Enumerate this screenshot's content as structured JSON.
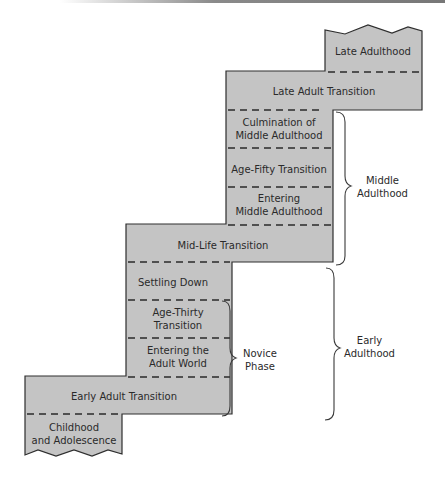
{
  "diagram": {
    "type": "staircase developmental periods",
    "fill_color": "#c4c4c4",
    "outline_color": "#2e2e2e",
    "stages": [
      {
        "id": "childhood",
        "label_line1": "Childhood",
        "label_line2": "and Adolescence"
      },
      {
        "id": "early-adult-transition",
        "label": "Early Adult Transition"
      },
      {
        "id": "entering-adult-world",
        "label_line1": "Entering the",
        "label_line2": "Adult World"
      },
      {
        "id": "age-thirty-transition",
        "label_line1": "Age-Thirty",
        "label_line2": "Transition"
      },
      {
        "id": "settling-down",
        "label": "Settling Down"
      },
      {
        "id": "mid-life-transition",
        "label": "Mid-Life Transition"
      },
      {
        "id": "entering-middle-adulthood",
        "label_line1": "Entering",
        "label_line2": "Middle Adulthood"
      },
      {
        "id": "age-fifty-transition",
        "label": "Age-Fifty Transition"
      },
      {
        "id": "culmination-middle-adulthood",
        "label_line1": "Culmination of",
        "label_line2": "Middle Adulthood"
      },
      {
        "id": "late-adult-transition",
        "label": "Late Adult Transition"
      },
      {
        "id": "late-adulthood",
        "label": "Late Adulthood"
      }
    ],
    "braces": {
      "novice_phase": "Novice\nPhase",
      "early_adulthood": "Early\nAdulthood",
      "middle_adulthood": "Middle\nAdulthood"
    }
  }
}
